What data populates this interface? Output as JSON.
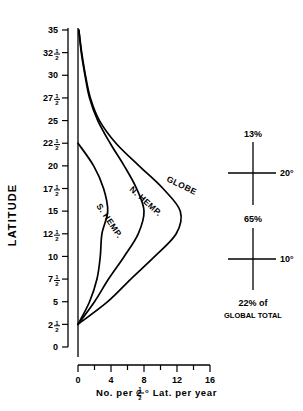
{
  "chart_data": {
    "type": "line",
    "title": "",
    "xlabel": "No. per 2½° Lat. per year",
    "ylabel": "LATITUDE",
    "orientation": "horizontal-value-vertical-category",
    "xlim": [
      0,
      16
    ],
    "ylim": [
      0,
      35
    ],
    "grid": false,
    "legend": "inline curve labels",
    "xticks": [
      0,
      4,
      8,
      12,
      16
    ],
    "xticklabels": [
      "0",
      "4",
      "8",
      "12",
      "16"
    ],
    "xminorticks": [
      2,
      6,
      10,
      14
    ],
    "yticks": [
      0,
      2.5,
      5,
      7.5,
      10,
      12.5,
      15,
      17.5,
      20,
      22.5,
      25,
      27.5,
      30,
      32.5,
      35
    ],
    "yticklabels": [
      "0",
      "2½",
      "5",
      "7½",
      "10",
      "12½",
      "15",
      "17½",
      "20",
      "22½",
      "25",
      "27½",
      "30",
      "32½",
      "35"
    ],
    "series": [
      {
        "name": "GLOBE",
        "label": "GLOBE",
        "peak_value": 12.4,
        "peak_latitude": 14.5,
        "latitudes": [
          2.5,
          5,
          7.5,
          10,
          12.5,
          15,
          17.5,
          20,
          22.5,
          25,
          27.5,
          30,
          32.5,
          35
        ],
        "values": [
          0.0,
          3.6,
          6.4,
          9.3,
          11.9,
          12.4,
          10.3,
          7.4,
          4.6,
          2.6,
          1.5,
          0.9,
          0.45,
          0.1
        ]
      },
      {
        "name": "N. HEMP.",
        "label": "N. HEMP.",
        "peak_value": 8.0,
        "peak_latitude": 15.0,
        "latitudes": [
          2.5,
          5,
          7.5,
          10,
          12.5,
          15,
          17.5,
          20,
          22.5,
          25,
          27.5,
          30,
          32.5,
          35
        ],
        "values": [
          0.0,
          2.0,
          3.7,
          5.6,
          7.3,
          8.0,
          7.1,
          5.6,
          3.9,
          2.4,
          1.4,
          0.85,
          0.4,
          0.1
        ]
      },
      {
        "name": "S. HEMP.",
        "label": "S. HEMP.",
        "peak_value": 3.6,
        "peak_latitude": 15.0,
        "latitudes": [
          2.5,
          5,
          7.5,
          10,
          12.5,
          15,
          17.5,
          20,
          22.5
        ],
        "values": [
          0.0,
          1.4,
          2.3,
          2.7,
          2.9,
          3.6,
          3.1,
          1.9,
          0.0
        ]
      }
    ],
    "annotations": {
      "title": "",
      "top_percent": "13%",
      "top_band_label": "20°",
      "middle_percent": "65%",
      "bottom_band_label": "10°",
      "bottom_percent": "22% of",
      "bottom_percent_line2": "GLOBAL TOTAL"
    }
  },
  "axes": {
    "y_title": "LATITUDE",
    "x_title_pre": "No. per 2",
    "x_title_frac_num": "1",
    "x_title_frac_den": "2",
    "x_title_post": "° Lat. per year"
  },
  "colors": {
    "ink": "#000000",
    "background": "#ffffff"
  }
}
